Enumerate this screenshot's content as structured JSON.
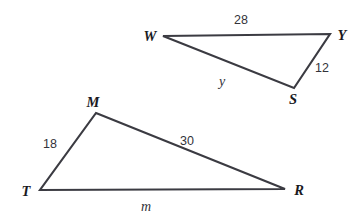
{
  "figure": {
    "stroke_color": "#3b3b42",
    "label_color": "#1a1a1f",
    "background": "#ffffff",
    "triangles": [
      {
        "name": "triangle-wys",
        "vertices": [
          {
            "label": "W",
            "x": 163,
            "y": 36
          },
          {
            "label": "Y",
            "x": 330,
            "y": 34
          },
          {
            "label": "S",
            "x": 294,
            "y": 88
          }
        ],
        "sides": [
          {
            "from": "W",
            "to": "Y",
            "label": "28"
          },
          {
            "from": "Y",
            "to": "S",
            "label": "12"
          },
          {
            "from": "S",
            "to": "W",
            "label": "y"
          }
        ]
      },
      {
        "name": "triangle-mtr",
        "vertices": [
          {
            "label": "M",
            "x": 96,
            "y": 113
          },
          {
            "label": "T",
            "x": 40,
            "y": 190
          },
          {
            "label": "R",
            "x": 285,
            "y": 189
          }
        ],
        "sides": [
          {
            "from": "T",
            "to": "M",
            "label": "18"
          },
          {
            "from": "M",
            "to": "R",
            "label": "30"
          },
          {
            "from": "T",
            "to": "R",
            "label": "m"
          }
        ]
      }
    ],
    "labels": {
      "vertex_w": "W",
      "vertex_y": "Y",
      "vertex_s": "S",
      "vertex_m": "M",
      "vertex_t": "T",
      "vertex_r": "R",
      "side_wy": "28",
      "side_ys": "12",
      "side_sw": "y",
      "side_tm": "18",
      "side_mr": "30",
      "side_tr": "m"
    }
  }
}
